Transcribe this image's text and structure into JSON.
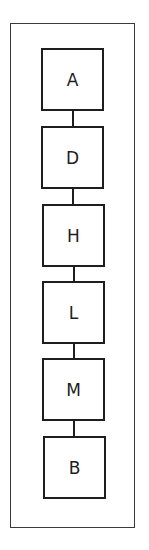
{
  "diagram": {
    "type": "vertical-chain",
    "nodes": [
      {
        "label": "A",
        "top": 48,
        "left": 41
      },
      {
        "label": "D",
        "top": 126,
        "left": 41
      },
      {
        "label": "H",
        "top": 204,
        "left": 42
      },
      {
        "label": "L",
        "top": 281,
        "left": 42
      },
      {
        "label": "M",
        "top": 358,
        "left": 42
      },
      {
        "label": "B",
        "top": 436,
        "left": 43
      }
    ],
    "edges": [
      {
        "from": "A",
        "to": "D"
      },
      {
        "from": "D",
        "to": "H"
      },
      {
        "from": "H",
        "to": "L"
      },
      {
        "from": "L",
        "to": "M"
      },
      {
        "from": "M",
        "to": "B"
      }
    ]
  }
}
